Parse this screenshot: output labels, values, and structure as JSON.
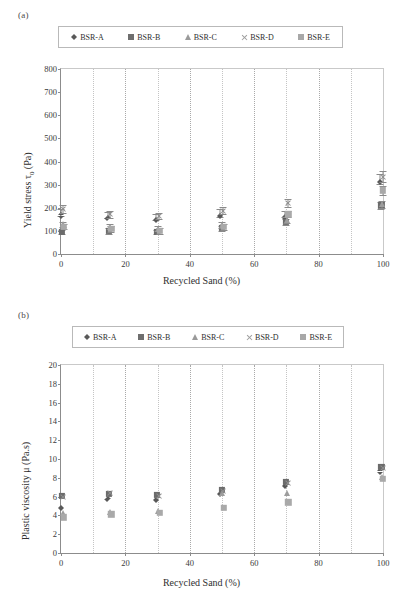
{
  "panels": {
    "a": {
      "label": "(a)",
      "legend": [
        {
          "name": "BSR-A",
          "marker": "diamond",
          "color": "#585858"
        },
        {
          "name": "BSR-B",
          "marker": "square",
          "color": "#6b6b6b"
        },
        {
          "name": "BSR-C",
          "marker": "triangle",
          "color": "#9d9d9d"
        },
        {
          "name": "BSR-D",
          "marker": "cross",
          "color": "#8f8f8f"
        },
        {
          "name": "BSR-E",
          "marker": "square-light",
          "color": "#a9a9a9"
        }
      ]
    },
    "b": {
      "label": "(b)",
      "legend": [
        {
          "name": "BSR-A",
          "marker": "diamond",
          "color": "#585858"
        },
        {
          "name": "BSR-B",
          "marker": "square",
          "color": "#6b6b6b"
        },
        {
          "name": "BSR-C",
          "marker": "triangle",
          "color": "#9d9d9d"
        },
        {
          "name": "BSR-D",
          "marker": "cross",
          "color": "#8f8f8f"
        },
        {
          "name": "BSR-E",
          "marker": "square-light",
          "color": "#a9a9a9"
        }
      ]
    }
  },
  "chart_data": [
    {
      "type": "scatter",
      "panel": "a",
      "title": "",
      "xlabel": "Recycled Sand (%)",
      "ylabel": "Yield stress τ0 (Pa)",
      "ylabel_parts": {
        "pre": "Yield stress τ",
        "sub": "0",
        "post": " (Pa)"
      },
      "xlim": [
        0,
        100
      ],
      "ylim": [
        0,
        800
      ],
      "xticks": [
        0,
        20,
        40,
        60,
        80,
        100
      ],
      "yticks": [
        0,
        100,
        200,
        300,
        400,
        500,
        600,
        700,
        800
      ],
      "xminor_step": 10,
      "grid": "vertical-dotted",
      "legend_position": "above-plot",
      "x": [
        0,
        15,
        30,
        50,
        70,
        100
      ],
      "series": [
        {
          "name": "BSR-A",
          "marker": "diamond",
          "values": [
            180,
            168,
            160,
            178,
            172,
            325
          ],
          "errors": [
            14,
            13,
            12,
            16,
            14,
            22
          ]
        },
        {
          "name": "BSR-B",
          "marker": "square",
          "values": [
            95,
            100,
            95,
            112,
            140,
            210
          ],
          "errors": [
            10,
            12,
            10,
            11,
            13,
            16
          ]
        },
        {
          "name": "BSR-C",
          "marker": "triangle",
          "values": [
            128,
            118,
            110,
            125,
            148,
            215
          ],
          "errors": [
            11,
            12,
            11,
            12,
            13,
            15
          ]
        },
        {
          "name": "BSR-D",
          "marker": "cross",
          "values": [
            195,
            172,
            165,
            188,
            222,
            335
          ],
          "errors": [
            18,
            15,
            14,
            17,
            18,
            24
          ]
        },
        {
          "name": "BSR-E",
          "marker": "square-light",
          "values": [
            118,
            108,
            100,
            118,
            172,
            275
          ],
          "errors": [
            12,
            13,
            12,
            13,
            14,
            18
          ]
        }
      ]
    },
    {
      "type": "scatter",
      "panel": "b",
      "title": "",
      "xlabel": "Recycled Sand (%)",
      "ylabel": "Plastic viscosity  μ (Pa.s)",
      "xlim": [
        0,
        100
      ],
      "ylim": [
        0,
        20
      ],
      "xticks": [
        0,
        20,
        40,
        60,
        80,
        100
      ],
      "yticks": [
        0,
        2,
        4,
        6,
        8,
        10,
        12,
        14,
        16,
        18,
        20
      ],
      "xminor_step": 10,
      "grid": "vertical-dotted",
      "legend_position": "above-plot",
      "x": [
        0,
        15,
        30,
        50,
        70,
        100
      ],
      "series": [
        {
          "name": "BSR-A",
          "marker": "diamond",
          "values": [
            5.1,
            6.1,
            6.0,
            6.6,
            7.5,
            9.0
          ],
          "errors": [
            0,
            0,
            0,
            0,
            0,
            0
          ]
        },
        {
          "name": "BSR-B",
          "marker": "square",
          "values": [
            6.1,
            6.3,
            6.2,
            6.7,
            7.6,
            9.2
          ],
          "errors": [
            0,
            0,
            0,
            0,
            0,
            0
          ]
        },
        {
          "name": "BSR-C",
          "marker": "triangle",
          "values": [
            4.3,
            4.4,
            4.5,
            6.4,
            6.4,
            8.1
          ],
          "errors": [
            0,
            0,
            0,
            0,
            0,
            0
          ]
        },
        {
          "name": "BSR-D",
          "marker": "cross",
          "values": [
            6.0,
            6.4,
            6.1,
            6.6,
            7.4,
            9.0
          ],
          "errors": [
            0,
            0,
            0,
            0,
            0,
            0
          ]
        },
        {
          "name": "BSR-E",
          "marker": "square-light",
          "values": [
            3.8,
            4.1,
            4.3,
            4.8,
            5.4,
            7.9
          ],
          "errors": [
            0,
            0,
            0,
            0,
            0,
            0
          ]
        }
      ]
    }
  ]
}
